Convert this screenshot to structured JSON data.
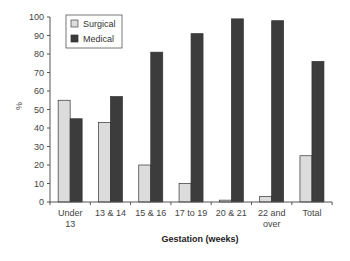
{
  "chart_data": {
    "type": "bar",
    "title": "",
    "xlabel": "Gestation (weeks)",
    "ylabel": "%",
    "ylim": [
      0,
      100
    ],
    "yticks": [
      0,
      10,
      20,
      30,
      40,
      50,
      60,
      70,
      80,
      90,
      100
    ],
    "grid": false,
    "legend_position": "upper-left-inside",
    "categories": [
      [
        "Under",
        "13"
      ],
      [
        "13 & 14"
      ],
      [
        "15 & 16"
      ],
      [
        "17 to 19"
      ],
      [
        "20 & 21"
      ],
      [
        "22 and",
        "over"
      ],
      [
        "Total"
      ]
    ],
    "series": [
      {
        "name": "Surgical",
        "color": "#dcdcdc",
        "values": [
          55,
          43,
          20,
          10,
          1,
          3,
          25
        ]
      },
      {
        "name": "Medical",
        "color": "#3c3c3c",
        "values": [
          45,
          57,
          81,
          91,
          99,
          98,
          76
        ]
      }
    ]
  }
}
